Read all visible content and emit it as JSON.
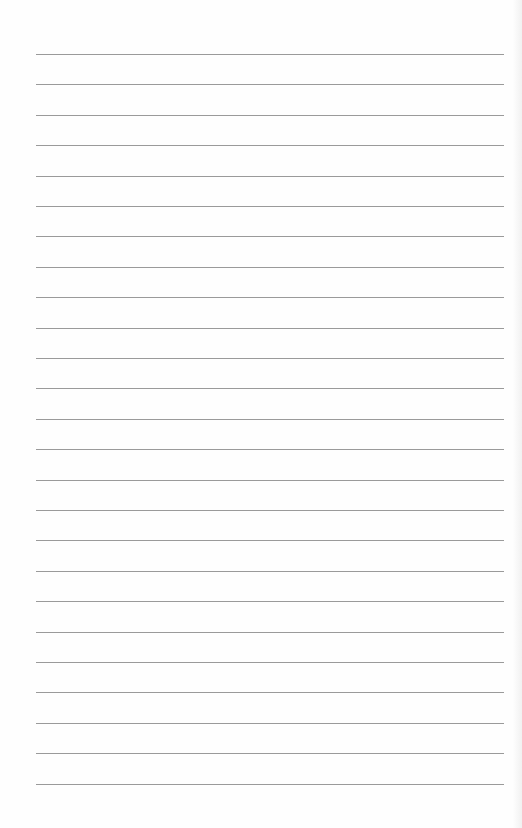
{
  "page": {
    "type": "lined-paper",
    "line_count": 25,
    "first_line_y": 54,
    "line_spacing": 30.4,
    "line_left": 36,
    "line_width": 468,
    "line_color": "#9a9a9a",
    "background": "#fefefe"
  }
}
